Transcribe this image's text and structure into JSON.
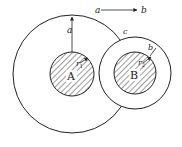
{
  "diagram": {
    "colors": {
      "stroke": "#222222",
      "background": "#ffffff"
    },
    "outer_circle": {
      "cx": 72,
      "cy": 74,
      "r": 59
    },
    "sphere_A": {
      "label": "A",
      "radius_label": "r",
      "radius_sub": "1",
      "cx": 72,
      "cy": 74,
      "r": 22
    },
    "shell_B": {
      "cx": 135,
      "cy": 73,
      "r": 36,
      "thickness_label": "b"
    },
    "sphere_B": {
      "label": "B",
      "radius_label": "r",
      "radius_sub": "2",
      "cx": 135,
      "cy": 73,
      "r": 21
    },
    "labels": {
      "a_top": "a",
      "b_top": "b",
      "a_vertical": "a",
      "c": "c"
    }
  }
}
